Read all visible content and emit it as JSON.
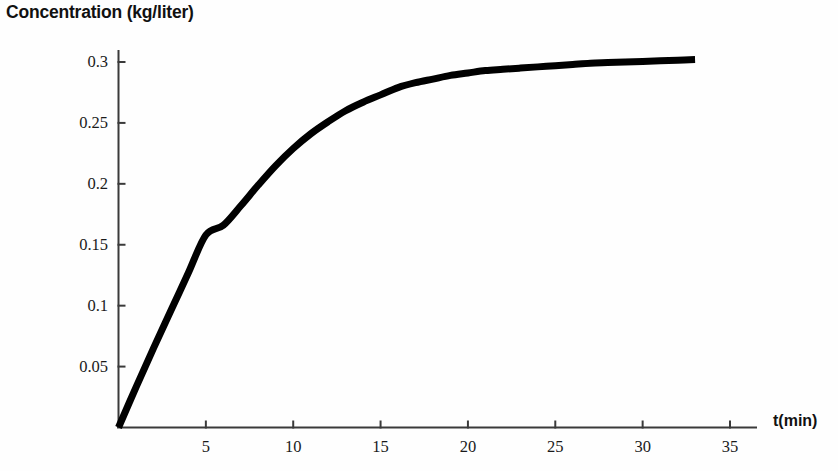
{
  "chart_data": {
    "type": "line",
    "title": "Concentration (kg/liter)",
    "xlabel": "t(min)",
    "ylabel": "Concentration (kg/liter)",
    "xlim": [
      0,
      36.5
    ],
    "ylim": [
      0,
      0.325
    ],
    "grid": false,
    "legend": null,
    "line_color": "#000000",
    "line_width_px": 7,
    "axis_color": "#3a3a3a",
    "xticks": [
      5,
      10,
      15,
      20,
      25,
      30,
      35
    ],
    "xtick_labels": [
      "5",
      "10",
      "15",
      "20",
      "25",
      "30",
      "35"
    ],
    "yticks": [
      0.05,
      0.1,
      0.15,
      0.2,
      0.25,
      0.3
    ],
    "ytick_labels": [
      "0.05",
      "0.1",
      "0.15",
      "0.2",
      "0.25",
      "0.3"
    ],
    "series": [
      {
        "name": "Concentration",
        "x": [
          0,
          1,
          2,
          3,
          4,
          5,
          6,
          7,
          8,
          9,
          10,
          11,
          12,
          13,
          14,
          15,
          16,
          17,
          18,
          19,
          20,
          21,
          22,
          23,
          24,
          25,
          26,
          27,
          28,
          29,
          30,
          31,
          32,
          33
        ],
        "y": [
          0,
          0.033,
          0.065,
          0.096,
          0.127,
          0.158,
          0.166,
          0.182,
          0.199,
          0.215,
          0.229,
          0.241,
          0.251,
          0.26,
          0.267,
          0.273,
          0.279,
          0.283,
          0.286,
          0.289,
          0.291,
          0.293,
          0.294,
          0.295,
          0.296,
          0.297,
          0.298,
          0.299,
          0.2995,
          0.3,
          0.3005,
          0.301,
          0.3015,
          0.302
        ]
      }
    ],
    "annotations": []
  },
  "axes": {
    "x_axis_name": "time-axis",
    "y_axis_name": "concentration-axis"
  }
}
